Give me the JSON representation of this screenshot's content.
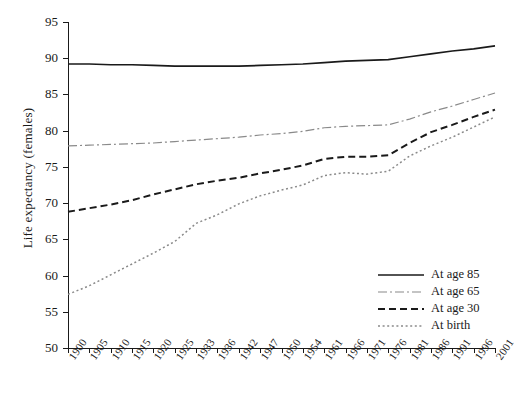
{
  "chart_data": {
    "type": "line",
    "title": "",
    "xlabel": "",
    "ylabel": "Life expectancy (females)",
    "ylim": [
      50,
      95
    ],
    "yticks": [
      50,
      55,
      60,
      65,
      70,
      75,
      80,
      85,
      90,
      95
    ],
    "grid": false,
    "legend_position": "bottom-right",
    "categories": [
      "1900",
      "1905",
      "1910",
      "1915",
      "1920",
      "1925",
      "1933",
      "1936",
      "1942",
      "1947",
      "1950",
      "1954",
      "1961",
      "1966",
      "1971",
      "1976",
      "1981",
      "1986",
      "1991",
      "1996",
      "2001"
    ],
    "series": [
      {
        "name": "At age 85",
        "style": "solid",
        "color": "#1a1a1a",
        "values": [
          89.2,
          89.2,
          89.1,
          89.1,
          89.0,
          88.9,
          88.9,
          88.9,
          88.9,
          89.0,
          89.1,
          89.2,
          89.4,
          89.6,
          89.7,
          89.8,
          90.2,
          90.6,
          91.0,
          91.3,
          91.7
        ]
      },
      {
        "name": "At age 65",
        "style": "dash-dot",
        "color": "#8a8a8a",
        "values": [
          77.9,
          78.0,
          78.1,
          78.2,
          78.3,
          78.5,
          78.7,
          78.9,
          79.1,
          79.4,
          79.6,
          79.9,
          80.4,
          80.6,
          80.7,
          80.8,
          81.6,
          82.6,
          83.4,
          84.3,
          85.2
        ]
      },
      {
        "name": "At age 30",
        "style": "dashed",
        "color": "#1a1a1a",
        "values": [
          68.8,
          69.3,
          69.8,
          70.4,
          71.2,
          71.9,
          72.6,
          73.1,
          73.5,
          74.1,
          74.6,
          75.2,
          76.1,
          76.4,
          76.4,
          76.6,
          78.3,
          79.8,
          80.8,
          81.9,
          82.9
        ]
      },
      {
        "name": "At birth",
        "style": "dotted",
        "color": "#8a8a8a",
        "values": [
          57.4,
          58.6,
          60.1,
          61.6,
          63.1,
          64.7,
          67.2,
          68.4,
          69.9,
          71.0,
          71.8,
          72.5,
          73.8,
          74.2,
          74.0,
          74.4,
          76.5,
          77.9,
          79.1,
          80.5,
          81.9
        ]
      }
    ]
  },
  "legend": {
    "items": [
      {
        "label": "At age 85"
      },
      {
        "label": "At age 65"
      },
      {
        "label": "At age 30"
      },
      {
        "label": "At birth"
      }
    ]
  }
}
